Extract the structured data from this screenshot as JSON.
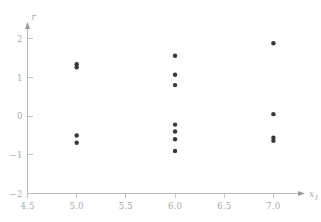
{
  "figure": {
    "background_color": "#ffffff",
    "width": 321,
    "height": 222
  },
  "chart_data": {
    "type": "scatter",
    "title": "",
    "subtitle": "",
    "xlabel": "x",
    "xlabel_subscript": "1",
    "ylabel": "r",
    "xlim": [
      4.5,
      7.25
    ],
    "ylim": [
      -2.0,
      2.25
    ],
    "xticks": [
      4.5,
      5.0,
      5.5,
      6.0,
      6.5,
      7.0
    ],
    "xticklabels": [
      "4.5",
      "5.0",
      "5.5",
      "6.0",
      "6.5",
      "7.0"
    ],
    "yticks": [
      2,
      1,
      0,
      -1,
      -2
    ],
    "yticklabels": [
      "2",
      "1",
      "0",
      "−1",
      "−2"
    ],
    "grid": false,
    "legend": null,
    "marker_color": "#3a3a3e",
    "marker_size": 3,
    "axis_color": "#b9b9bd",
    "tick_label_color": "#a9a9ae",
    "series": [
      {
        "name": "residuals",
        "points": [
          {
            "x": 5.0,
            "y": 1.34
          },
          {
            "x": 5.0,
            "y": 1.26
          },
          {
            "x": 5.0,
            "y": -0.5
          },
          {
            "x": 5.0,
            "y": -0.69
          },
          {
            "x": 6.0,
            "y": 1.56
          },
          {
            "x": 6.0,
            "y": 1.07
          },
          {
            "x": 6.0,
            "y": 0.8
          },
          {
            "x": 6.0,
            "y": -0.22
          },
          {
            "x": 6.0,
            "y": -0.4
          },
          {
            "x": 6.0,
            "y": -0.6
          },
          {
            "x": 6.0,
            "y": -0.9
          },
          {
            "x": 7.0,
            "y": 1.88
          },
          {
            "x": 7.0,
            "y": 0.05
          },
          {
            "x": 7.0,
            "y": -0.56
          },
          {
            "x": 7.0,
            "y": -0.64
          }
        ]
      }
    ]
  }
}
